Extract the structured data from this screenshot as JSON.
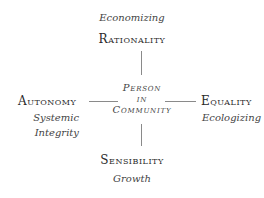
{
  "diagram": {
    "top": {
      "label": "Rationality",
      "sublabel": "Economizing"
    },
    "left": {
      "label": "Autonomy",
      "sublabel_lines": [
        "Systemic",
        "Integrity"
      ]
    },
    "right": {
      "label": "Equality",
      "sublabel": "Ecologizing"
    },
    "bottom": {
      "label": "Sensibility",
      "sublabel": "Growth"
    },
    "center": {
      "lines": [
        "Person",
        "in",
        "Community"
      ]
    },
    "colors": {
      "text": "#2a2a2a",
      "line": "#8a8a8a",
      "background": "#ffffff"
    }
  }
}
